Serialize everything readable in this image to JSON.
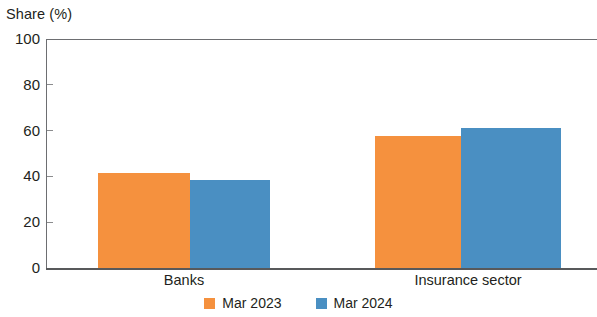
{
  "chart_data": {
    "type": "bar",
    "title": "",
    "xlabel": "",
    "ylabel": "Share (%)",
    "ylim": [
      0,
      100
    ],
    "yticks": [
      0,
      20,
      40,
      60,
      80,
      100
    ],
    "ytick_labels": [
      "0",
      "20",
      "40",
      "60",
      "80",
      "100"
    ],
    "grid": false,
    "legend_position": "bottom-center",
    "categories": [
      "Banks",
      "Insurance sector"
    ],
    "series": [
      {
        "name": "Mar 2023",
        "color": "#f5913e",
        "values": [
          41.5,
          57.5
        ]
      },
      {
        "name": "Mar 2024",
        "color": "#4a8fc2",
        "values": [
          38.5,
          61.0
        ]
      }
    ]
  },
  "colors": {
    "series_0": "#f5913e",
    "series_1": "#4a8fc2",
    "axis": "#58595b",
    "text": "#231f20"
  }
}
